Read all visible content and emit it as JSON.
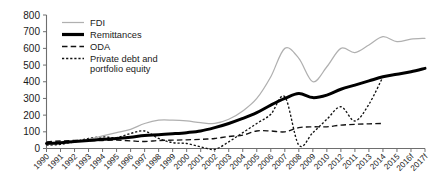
{
  "chart_data": {
    "type": "line",
    "title": "",
    "subtitle": "",
    "xlabel": "",
    "ylabel": "",
    "ylim": [
      0,
      800
    ],
    "yticks": [
      0,
      100,
      200,
      300,
      400,
      500,
      600,
      700,
      800
    ],
    "grid": false,
    "legend_position": "top-left-inside",
    "x_tick_labels": [
      "1990",
      "1991",
      "1992",
      "1993",
      "1994",
      "1995",
      "1996",
      "1997",
      "1998",
      "1999",
      "2000",
      "2001",
      "2002",
      "2003",
      "2004",
      "2005",
      "2006",
      "2007",
      "2008",
      "2009",
      "2010",
      "2012",
      "2011",
      "2013",
      "2014",
      "2015",
      "2016f",
      "2017f"
    ],
    "x": [
      1990,
      1991,
      1992,
      1993,
      1994,
      1995,
      1996,
      1997,
      1998,
      1999,
      2000,
      2001,
      2002,
      2003,
      2004,
      2005,
      2006,
      2007,
      2008,
      2009,
      2010,
      2011,
      2012,
      2013,
      2014,
      2015,
      2016,
      2017
    ],
    "series": [
      {
        "name": "FDI",
        "style": "thin-gray-solid",
        "color": "#b0b0b0",
        "values": [
          25,
          30,
          40,
          55,
          75,
          95,
          115,
          150,
          170,
          170,
          165,
          155,
          150,
          175,
          225,
          300,
          430,
          600,
          540,
          400,
          490,
          600,
          575,
          620,
          670,
          640,
          655,
          660
        ]
      },
      {
        "name": "Remittances",
        "style": "thick-black-solid",
        "color": "#000000",
        "values": [
          30,
          35,
          42,
          48,
          55,
          60,
          68,
          78,
          82,
          88,
          95,
          105,
          125,
          150,
          180,
          215,
          260,
          300,
          330,
          305,
          320,
          355,
          380,
          405,
          430,
          445,
          460,
          480
        ]
      },
      {
        "name": "ODA",
        "style": "long-dash",
        "color": "#111111",
        "values": [
          40,
          45,
          48,
          46,
          48,
          50,
          46,
          42,
          48,
          50,
          52,
          55,
          60,
          72,
          80,
          105,
          105,
          100,
          125,
          130,
          130,
          140,
          145,
          148,
          150,
          null,
          null,
          null
        ]
      },
      {
        "name": "Private debt and portfolio equity",
        "style": "fine-dotted",
        "color": "#111111",
        "values": [
          20,
          25,
          40,
          60,
          70,
          65,
          90,
          105,
          60,
          35,
          30,
          10,
          -5,
          40,
          95,
          150,
          205,
          310,
          20,
          95,
          175,
          250,
          165,
          265,
          430,
          null,
          null,
          null
        ]
      }
    ],
    "legend": [
      {
        "label": "FDI",
        "style": "thin-gray-solid"
      },
      {
        "label": "Remittances",
        "style": "thick-black-solid"
      },
      {
        "label": "ODA",
        "style": "long-dash"
      },
      {
        "label": "Private debt and",
        "label_line2": "portfolio equity",
        "style": "fine-dotted"
      }
    ]
  },
  "legend_text": {
    "fdi": "FDI",
    "remittances": "Remittances",
    "oda": "ODA",
    "private_debt_line1": "Private debt and",
    "private_debt_line2": "portfolio equity"
  }
}
